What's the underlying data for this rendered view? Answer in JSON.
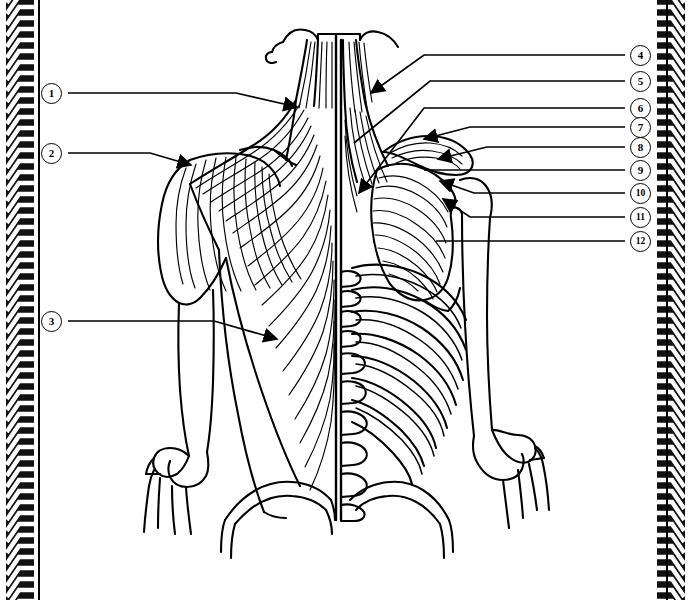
{
  "figure": {
    "view": "posterior",
    "stroke_color": "#000000",
    "background_color": "#ffffff"
  },
  "border": {
    "style": "braided-chevron",
    "color": "#111111",
    "sides": [
      "left",
      "right"
    ]
  },
  "leaders": {
    "left_numbers": [
      "1",
      "2",
      "3"
    ],
    "right_numbers": [
      "4",
      "5",
      "6",
      "7",
      "8",
      "9",
      "10",
      "11",
      "12"
    ]
  },
  "callouts": [
    {
      "number": "1",
      "side": "left",
      "cx": 52,
      "cy": 93,
      "target_x": 295,
      "target_y": 105,
      "arrow": true
    },
    {
      "number": "2",
      "side": "left",
      "cx": 52,
      "cy": 153,
      "target_x": 190,
      "target_y": 163,
      "arrow": true
    },
    {
      "number": "3",
      "side": "left",
      "cx": 52,
      "cy": 321,
      "target_x": 275,
      "target_y": 337,
      "arrow": true
    },
    {
      "number": "4",
      "side": "right",
      "cx": 641,
      "cy": 55,
      "target_x": 369,
      "target_y": 92,
      "arrow": true
    },
    {
      "number": "5",
      "side": "right",
      "cx": 641,
      "cy": 81,
      "target_x": 352,
      "target_y": 143,
      "arrow": false
    },
    {
      "number": "6",
      "side": "right",
      "cx": 641,
      "cy": 108,
      "target_x": 357,
      "target_y": 192,
      "arrow": true
    },
    {
      "number": "7",
      "side": "right",
      "cx": 641,
      "cy": 127,
      "target_x": 422,
      "target_y": 137,
      "arrow": true
    },
    {
      "number": "8",
      "side": "right",
      "cx": 641,
      "cy": 147,
      "target_x": 436,
      "target_y": 157,
      "arrow": true
    },
    {
      "number": "9",
      "side": "right",
      "cx": 641,
      "cy": 170,
      "target_x": 423,
      "target_y": 179,
      "arrow": false
    },
    {
      "number": "10",
      "side": "right",
      "cx": 641,
      "cy": 193,
      "target_x": 438,
      "target_y": 180,
      "arrow": true
    },
    {
      "number": "11",
      "side": "right",
      "cx": 641,
      "cy": 217,
      "target_x": 441,
      "target_y": 197,
      "arrow": true
    },
    {
      "number": "12",
      "side": "right",
      "cx": 641,
      "cy": 241,
      "target_x": 435,
      "target_y": 241,
      "arrow": false
    }
  ]
}
